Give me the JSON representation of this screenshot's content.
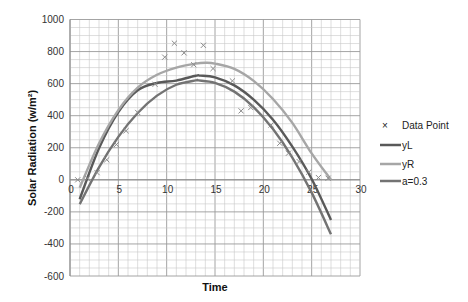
{
  "chart_data": {
    "type": "scatter",
    "title": "",
    "xlabel": "Time",
    "ylabel": "Solar Radiation (w/m²)",
    "xlim": [
      0,
      30
    ],
    "ylim": [
      -600,
      1000
    ],
    "x_ticks": [
      0,
      5,
      10,
      15,
      20,
      25,
      30
    ],
    "y_ticks": [
      1000,
      800,
      600,
      400,
      200,
      0,
      -200,
      -400,
      -600
    ],
    "grid": true,
    "legend_position": "right",
    "series": [
      {
        "name": "Data Point",
        "kind": "markers",
        "marker": "x",
        "color": "#8c8c8c",
        "x": [
          0.8,
          1.8,
          2.8,
          3.8,
          4.8,
          5.8,
          7.0,
          8.8,
          9.8,
          10.8,
          11.8,
          12.8,
          13.8,
          14.8,
          16.8,
          17.7,
          18.7,
          20.8,
          21.7,
          22.6,
          23.7,
          24.7,
          25.7,
          26.7
        ],
        "y": [
          0,
          10,
          45,
          125,
          220,
          306,
          420,
          596,
          765,
          852,
          792,
          718,
          839,
          694,
          617,
          430,
          451,
          342,
          228,
          166,
          114,
          48,
          14,
          10
        ]
      },
      {
        "name": "yL",
        "kind": "line",
        "color": "#595959",
        "x": [
          1,
          3,
          5,
          7,
          9,
          11,
          13,
          13.5,
          15,
          17,
          19,
          21,
          23,
          25,
          27
        ],
        "y": [
          -121,
          197,
          423,
          559,
          604,
          619,
          649,
          650,
          639,
          589,
          500,
          375,
          207,
          5,
          -250
        ]
      },
      {
        "name": "yR",
        "kind": "line",
        "color": "#a6a6a6",
        "x": [
          1,
          3,
          5,
          7,
          9,
          11,
          13,
          14,
          15,
          17,
          19,
          21,
          23,
          25,
          27
        ],
        "y": [
          -50,
          227,
          435,
          575,
          655,
          700,
          725,
          730,
          725,
          692,
          617,
          504,
          355,
          165,
          0
        ]
      },
      {
        "name": "a=0.3",
        "kind": "line",
        "color": "#737373",
        "x": [
          1,
          3,
          5,
          7,
          9,
          11,
          13,
          13.3,
          15,
          17,
          19,
          21,
          23,
          25,
          27
        ],
        "y": [
          -152,
          78,
          268,
          417,
          525,
          593,
          620,
          620,
          605,
          550,
          454,
          317,
          139,
          -80,
          -340
        ]
      }
    ]
  },
  "legend": {
    "items": [
      {
        "label": "Data Point",
        "symbol": "×"
      },
      {
        "label": "yL"
      },
      {
        "label": "yR"
      },
      {
        "label": "a=0.3"
      }
    ]
  }
}
